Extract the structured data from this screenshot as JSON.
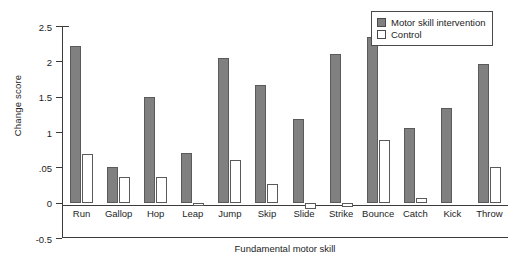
{
  "chart_data": {
    "type": "bar",
    "title": "",
    "xlabel": "Fundamental motor skill",
    "ylabel": "Change score",
    "ylim": [
      -0.5,
      2.5
    ],
    "ytick_values": [
      2.5,
      2,
      1.5,
      1,
      0.5,
      0,
      -0.5
    ],
    "ytick_labels": [
      "2.5",
      "2",
      "1.5",
      "1",
      ".05",
      "0",
      "-0.5"
    ],
    "grid": false,
    "legend_position": "top-right",
    "categories": [
      "Run",
      "Gallop",
      "Hop",
      "Leap",
      "Jump",
      "Skip",
      "Slide",
      "Strike",
      "Bounce",
      "Catch",
      "Kick",
      "Throw"
    ],
    "series": [
      {
        "name": "Motor skill intervention",
        "color": "#808080",
        "values": [
          2.22,
          0.51,
          1.5,
          0.7,
          2.05,
          1.66,
          1.18,
          2.1,
          2.35,
          1.05,
          1.34,
          1.96
        ]
      },
      {
        "name": "Control",
        "color": "#ffffff",
        "values": [
          0.69,
          0.37,
          0.36,
          -0.05,
          0.6,
          0.27,
          -0.09,
          -0.06,
          0.88,
          0.07,
          0.0,
          0.5
        ]
      }
    ]
  },
  "legend": {
    "items": [
      {
        "label": "Motor skill intervention",
        "swatch": "filled"
      },
      {
        "label": "Control",
        "swatch": "empty"
      }
    ]
  }
}
